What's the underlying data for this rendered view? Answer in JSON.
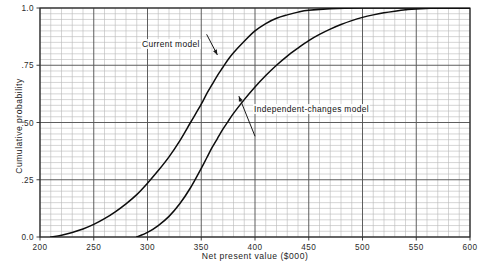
{
  "figure": {
    "background_color": "#ffffff",
    "ink_color": "#1a1a1a",
    "grid_minor_color": "#b9b9b9",
    "grid_major_color": "#555555",
    "frame_color": "#2a2a2a",
    "curve_color": "#0d0d0d"
  },
  "axes": {
    "x_title": "Net present value ($000)",
    "y_title": "Cumulative probability",
    "x_tick_labels": [
      "200",
      "250",
      "300",
      "350",
      "400",
      "450",
      "500",
      "550",
      "600"
    ],
    "x_tick_values": [
      200,
      250,
      300,
      350,
      400,
      450,
      500,
      550,
      600
    ],
    "y_tick_labels": [
      "0.0",
      ".25",
      ".50",
      ".75",
      "1.0"
    ],
    "y_tick_values": [
      0.0,
      0.25,
      0.5,
      0.75,
      1.0
    ],
    "x_range": [
      200,
      600
    ],
    "y_range": [
      0,
      1
    ],
    "x_minor_step": 10,
    "y_minor_step": 0.025,
    "grid": "on"
  },
  "annotations": [
    {
      "name": "current-model",
      "text": "Current model",
      "leader": {
        "from_x": 355,
        "from_y": 0.885,
        "to_x": 365,
        "to_y": 0.795
      }
    },
    {
      "name": "independent-changes-model",
      "text": "Independent-changes model",
      "leader": {
        "from_x": 400,
        "from_y": 0.44,
        "to_x": 385,
        "to_y": 0.615
      }
    }
  ],
  "chart_data": {
    "type": "line",
    "title": "",
    "subtitle": "",
    "xlabel": "Net present value ($000)",
    "ylabel": "Cumulative probability",
    "xlim": [
      200,
      600
    ],
    "ylim": [
      0,
      1
    ],
    "grid": "on",
    "legend_position": "inline-annotations",
    "x_ticks": [
      200,
      250,
      300,
      350,
      400,
      450,
      500,
      550,
      600
    ],
    "y_ticks": [
      0.0,
      0.25,
      0.5,
      0.75,
      1.0
    ],
    "series": [
      {
        "name": "Current model",
        "x": [
          210,
          220,
          230,
          240,
          250,
          260,
          270,
          280,
          290,
          300,
          310,
          320,
          330,
          340,
          350,
          355,
          360,
          365,
          370,
          375,
          380,
          390,
          400,
          410,
          420,
          430,
          440,
          450,
          470,
          500,
          550,
          600
        ],
        "values": [
          0.0,
          0.008,
          0.02,
          0.035,
          0.055,
          0.08,
          0.11,
          0.145,
          0.185,
          0.235,
          0.29,
          0.35,
          0.42,
          0.5,
          0.58,
          0.625,
          0.665,
          0.705,
          0.74,
          0.775,
          0.805,
          0.855,
          0.9,
          0.932,
          0.955,
          0.97,
          0.982,
          0.99,
          0.997,
          1.0,
          1.0,
          1.0
        ]
      },
      {
        "name": "Independent-changes model",
        "x": [
          290,
          300,
          310,
          320,
          330,
          340,
          350,
          355,
          360,
          365,
          370,
          375,
          380,
          390,
          400,
          410,
          420,
          430,
          440,
          450,
          460,
          470,
          480,
          490,
          500,
          510,
          520,
          530,
          540,
          550,
          575,
          600
        ],
        "values": [
          0.0,
          0.02,
          0.05,
          0.09,
          0.145,
          0.215,
          0.3,
          0.345,
          0.39,
          0.43,
          0.47,
          0.505,
          0.54,
          0.6,
          0.655,
          0.705,
          0.75,
          0.79,
          0.825,
          0.858,
          0.885,
          0.908,
          0.928,
          0.945,
          0.959,
          0.97,
          0.979,
          0.986,
          0.992,
          0.996,
          1.0,
          1.0
        ]
      }
    ],
    "annotations": [
      {
        "text": "Current model",
        "target_series": "Current model"
      },
      {
        "text": "Independent-changes model",
        "target_series": "Independent-changes model"
      }
    ]
  }
}
